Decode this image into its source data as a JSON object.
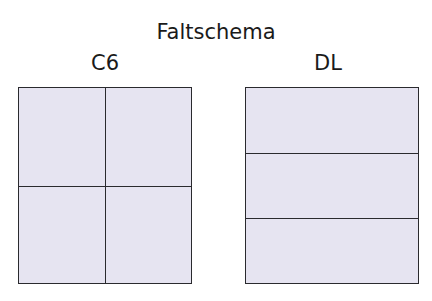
{
  "title": "Faltschema",
  "diagrams": [
    {
      "label": "C6",
      "fold": "cross",
      "panels": 4,
      "vertical_folds": 1,
      "horizontal_folds": 1
    },
    {
      "label": "DL",
      "fold": "letter",
      "panels": 3,
      "vertical_folds": 0,
      "horizontal_folds": 2
    }
  ],
  "colors": {
    "paper": "#e6e4f1",
    "fold_line": "#2a2a2e"
  }
}
